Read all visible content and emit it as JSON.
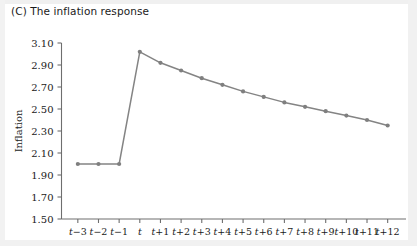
{
  "figure": {
    "title": "(C) The inflation response",
    "panel_letter": "(C)"
  },
  "chart_data": {
    "type": "line",
    "title": "(C) The inflation response",
    "xlabel": "",
    "ylabel": "Inflation",
    "categories": [
      "t−3",
      "t−2",
      "t−1",
      "t",
      "t+1",
      "t+2",
      "t+3",
      "t+4",
      "t+5",
      "t+6",
      "t+7",
      "t+8",
      "t+9",
      "t+10",
      "t+11",
      "t+12"
    ],
    "values": [
      2.0,
      2.0,
      2.0,
      3.02,
      2.92,
      2.85,
      2.78,
      2.72,
      2.66,
      2.61,
      2.56,
      2.52,
      2.48,
      2.44,
      2.4,
      2.35
    ],
    "series": [
      {
        "name": "Inflation",
        "values": [
          2.0,
          2.0,
          2.0,
          3.02,
          2.92,
          2.85,
          2.78,
          2.72,
          2.66,
          2.61,
          2.56,
          2.52,
          2.48,
          2.44,
          2.4,
          2.35
        ],
        "color": "#7f7f7f",
        "marker": "circle"
      }
    ],
    "ylim": [
      1.5,
      3.1
    ],
    "ytick_values": [
      1.5,
      1.7,
      1.9,
      2.1,
      2.3,
      2.5,
      2.7,
      2.9,
      3.1
    ],
    "ytick_labels": [
      "1.50",
      "1.70",
      "1.90",
      "2.10",
      "2.30",
      "2.50",
      "2.70",
      "2.90",
      "3.10"
    ],
    "ytick_step": 0.2,
    "xtick_labels": [
      "t−3",
      "t−2",
      "t−1",
      "t",
      "t+1",
      "t+2",
      "t+3",
      "t+4",
      "t+5",
      "t+6",
      "t+7",
      "t+8",
      "t+9",
      "t+10",
      "t+11",
      "t+12"
    ],
    "grid": false,
    "legend": null,
    "legend_position": "none",
    "line_color": "#848484",
    "marker_color": "#7f7f7f",
    "axis_color": "#6e6e6e",
    "background_color": "#ffffff"
  }
}
